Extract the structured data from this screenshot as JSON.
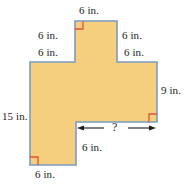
{
  "figure": {
    "kind": "rectilinear-polygon-dimension-diagram",
    "unit": "in.",
    "colors": {
      "fill": "#F5CE7E",
      "outline": "#7A9CC0",
      "right_angle_marker": "#E2533A",
      "text": "#1C1C1C",
      "arrow": "#1C1C1C",
      "background": "#FFFFFF"
    },
    "labels": {
      "top": "6 in.",
      "upper_left_vertical": "6 in.",
      "upper_left_horizontal": "6 in.",
      "upper_right_vertical": "6 in.",
      "upper_right_horizontal": "6 in.",
      "right_vertical": "9 in.",
      "left_vertical": "15 in.",
      "notch_vertical": "6 in.",
      "bottom": "6 in.",
      "unknown": "?"
    },
    "right_angle_markers": [
      "top-protrusion-left-corner",
      "lower-right-notch-corner",
      "bottom-left-corner"
    ],
    "dimension_arrow": {
      "label": "?",
      "style": "double-headed",
      "orientation": "horizontal"
    }
  }
}
